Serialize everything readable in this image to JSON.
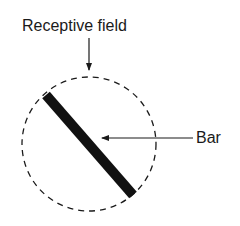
{
  "diagram": {
    "labels": {
      "receptive_field": "Receptive field",
      "bar": "Bar"
    },
    "colors": {
      "ink": "#1a1a1a",
      "background": "#ffffff"
    },
    "shapes": {
      "receptive_field_circle": {
        "style": "dashed",
        "cx": 89,
        "cy": 144,
        "r": 67
      },
      "bar": {
        "orientation": "diagonal (top-left to bottom-right)",
        "x1": 46,
        "y1": 95,
        "x2": 133,
        "y2": 195,
        "thickness": 10
      }
    },
    "arrows": [
      {
        "from": "receptive_field_label",
        "to": "receptive_field_circle",
        "direction": "down"
      },
      {
        "from": "bar_label",
        "to": "bar",
        "direction": "left"
      }
    ]
  }
}
